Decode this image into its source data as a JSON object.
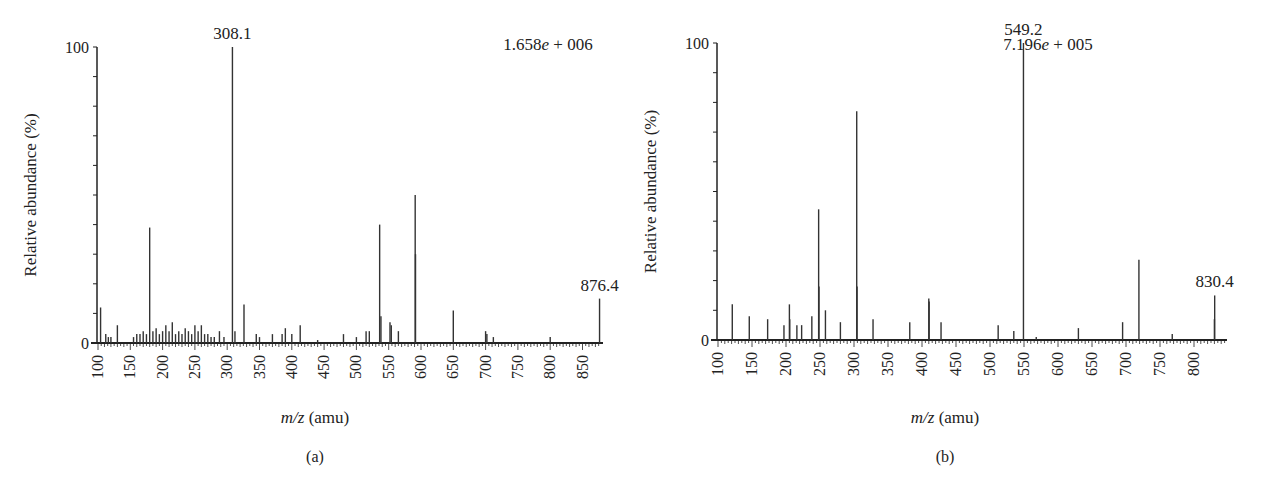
{
  "chart_data": [
    {
      "type": "bar",
      "subtype": "mass-spectrum",
      "panel_label": "(a)",
      "xlabel_italic": "m/z",
      "xlabel_unit": " (amu)",
      "ylabel": "Relative abundance (%)",
      "ytick_labels": [
        "0",
        "100"
      ],
      "ylim": [
        0,
        100
      ],
      "xlim": [
        100,
        880
      ],
      "xtick_labels": [
        "100",
        "150",
        "200",
        "250",
        "300",
        "350",
        "400",
        "450",
        "500",
        "550",
        "600",
        "650",
        "700",
        "750",
        "800",
        "850"
      ],
      "intensity_label": "1.658e + 006",
      "peak_labels": [
        {
          "text": "308.1",
          "x": 308.1,
          "y": 100
        },
        {
          "text": "876.4",
          "x": 876.4,
          "y": 15
        }
      ],
      "peaks": [
        {
          "x": 104,
          "y": 12
        },
        {
          "x": 112,
          "y": 3
        },
        {
          "x": 116,
          "y": 2
        },
        {
          "x": 120,
          "y": 2
        },
        {
          "x": 130,
          "y": 6
        },
        {
          "x": 155,
          "y": 2
        },
        {
          "x": 160,
          "y": 3
        },
        {
          "x": 165,
          "y": 3
        },
        {
          "x": 170,
          "y": 4
        },
        {
          "x": 175,
          "y": 3
        },
        {
          "x": 180,
          "y": 39
        },
        {
          "x": 185,
          "y": 4
        },
        {
          "x": 190,
          "y": 5
        },
        {
          "x": 195,
          "y": 3
        },
        {
          "x": 200,
          "y": 4
        },
        {
          "x": 205,
          "y": 6
        },
        {
          "x": 210,
          "y": 4
        },
        {
          "x": 215,
          "y": 7
        },
        {
          "x": 220,
          "y": 3
        },
        {
          "x": 225,
          "y": 4
        },
        {
          "x": 230,
          "y": 3
        },
        {
          "x": 235,
          "y": 5
        },
        {
          "x": 240,
          "y": 4
        },
        {
          "x": 245,
          "y": 3
        },
        {
          "x": 250,
          "y": 6
        },
        {
          "x": 255,
          "y": 4
        },
        {
          "x": 260,
          "y": 6
        },
        {
          "x": 265,
          "y": 3
        },
        {
          "x": 270,
          "y": 3
        },
        {
          "x": 275,
          "y": 2
        },
        {
          "x": 280,
          "y": 2
        },
        {
          "x": 288,
          "y": 4
        },
        {
          "x": 295,
          "y": 2
        },
        {
          "x": 308.1,
          "y": 100
        },
        {
          "x": 312,
          "y": 4
        },
        {
          "x": 326,
          "y": 13
        },
        {
          "x": 345,
          "y": 3
        },
        {
          "x": 350,
          "y": 2
        },
        {
          "x": 370,
          "y": 3
        },
        {
          "x": 385,
          "y": 3
        },
        {
          "x": 390,
          "y": 5
        },
        {
          "x": 400,
          "y": 3
        },
        {
          "x": 413,
          "y": 6
        },
        {
          "x": 440,
          "y": 1
        },
        {
          "x": 480,
          "y": 3
        },
        {
          "x": 500,
          "y": 2
        },
        {
          "x": 515,
          "y": 4
        },
        {
          "x": 520,
          "y": 4
        },
        {
          "x": 536,
          "y": 40
        },
        {
          "x": 538,
          "y": 9
        },
        {
          "x": 552,
          "y": 7
        },
        {
          "x": 554,
          "y": 6
        },
        {
          "x": 565,
          "y": 4
        },
        {
          "x": 591,
          "y": 50
        },
        {
          "x": 591.5,
          "y": 30
        },
        {
          "x": 650,
          "y": 11
        },
        {
          "x": 700,
          "y": 4
        },
        {
          "x": 702,
          "y": 3
        },
        {
          "x": 712,
          "y": 2
        },
        {
          "x": 800,
          "y": 2
        },
        {
          "x": 876.4,
          "y": 15
        }
      ]
    },
    {
      "type": "bar",
      "subtype": "mass-spectrum",
      "panel_label": "(b)",
      "xlabel_italic": "m/z",
      "xlabel_unit": " (amu)",
      "ylabel": "Relative abundance (%)",
      "ytick_labels": [
        "0",
        "100"
      ],
      "ylim": [
        0,
        100
      ],
      "xlim": [
        100,
        835
      ],
      "xtick_labels": [
        "100",
        "150",
        "200",
        "250",
        "300",
        "350",
        "400",
        "450",
        "500",
        "550",
        "600",
        "650",
        "700",
        "750",
        "800"
      ],
      "intensity_label": "7.196e + 005",
      "peak_labels": [
        {
          "text": "549.2",
          "x": 549.2,
          "y": 100
        },
        {
          "text": "830.4",
          "x": 830.4,
          "y": 15
        }
      ],
      "peaks": [
        {
          "x": 121,
          "y": 12
        },
        {
          "x": 146,
          "y": 8
        },
        {
          "x": 173,
          "y": 7
        },
        {
          "x": 197,
          "y": 5
        },
        {
          "x": 205,
          "y": 12
        },
        {
          "x": 205.5,
          "y": 7
        },
        {
          "x": 216,
          "y": 5
        },
        {
          "x": 223,
          "y": 5
        },
        {
          "x": 238,
          "y": 8
        },
        {
          "x": 248,
          "y": 44
        },
        {
          "x": 248.5,
          "y": 18
        },
        {
          "x": 258,
          "y": 10
        },
        {
          "x": 280,
          "y": 6
        },
        {
          "x": 304,
          "y": 77
        },
        {
          "x": 304.5,
          "y": 18
        },
        {
          "x": 328,
          "y": 7
        },
        {
          "x": 382,
          "y": 6
        },
        {
          "x": 410,
          "y": 14
        },
        {
          "x": 410.5,
          "y": 13
        },
        {
          "x": 428,
          "y": 6
        },
        {
          "x": 512,
          "y": 5
        },
        {
          "x": 535,
          "y": 3
        },
        {
          "x": 549.2,
          "y": 100
        },
        {
          "x": 568,
          "y": 1
        },
        {
          "x": 630,
          "y": 4
        },
        {
          "x": 695,
          "y": 6
        },
        {
          "x": 719,
          "y": 27
        },
        {
          "x": 768,
          "y": 2
        },
        {
          "x": 830.4,
          "y": 15
        },
        {
          "x": 830,
          "y": 7
        }
      ]
    }
  ]
}
